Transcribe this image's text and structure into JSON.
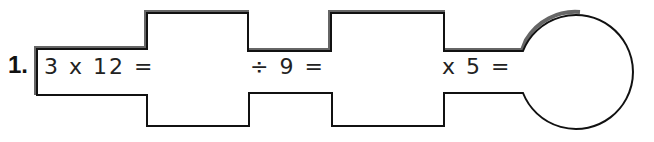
{
  "problem": {
    "number": "1.",
    "step1": "3 x 12 =",
    "step2": "÷ 9 =",
    "step3": "x 5 =",
    "answers": [
      "",
      "",
      ""
    ]
  },
  "colors": {
    "outline": "#111111",
    "shadow": "#555555"
  }
}
